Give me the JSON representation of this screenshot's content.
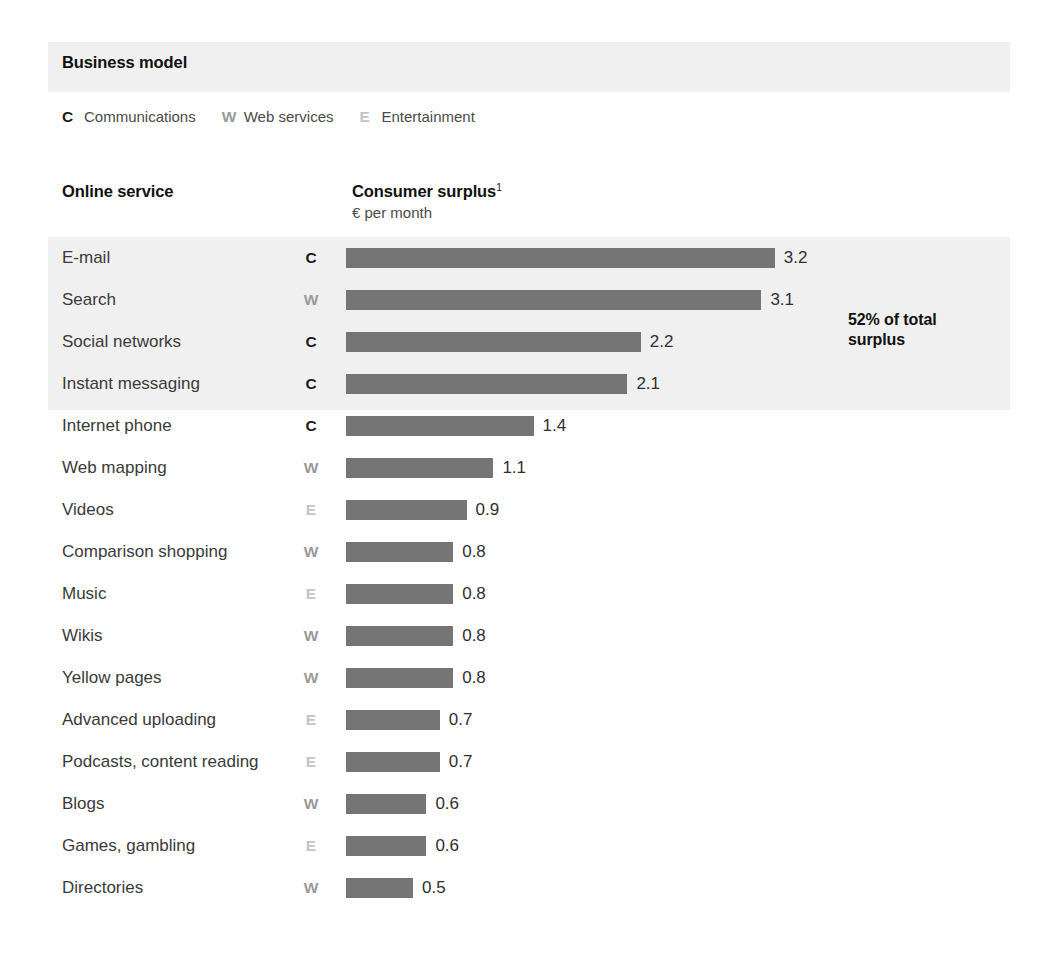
{
  "business_model": {
    "heading": "Business model",
    "legend": [
      {
        "key": "C",
        "label": "Communications",
        "color": "#1a1a1a"
      },
      {
        "key": "W",
        "label": "Web services",
        "color": "#9a9a9a"
      },
      {
        "key": "E",
        "label": "Entertainment",
        "color": "#c4c4c4"
      }
    ]
  },
  "columns": {
    "service": "Online service",
    "surplus_main": "Consumer surplus",
    "surplus_footnote_marker": "1",
    "surplus_sub": "€ per month"
  },
  "highlight": {
    "note_line1": "52% of total",
    "note_line2": "surplus",
    "rows_covered": 4,
    "band_color": "#f0f0f0"
  },
  "chart_data": {
    "type": "bar",
    "orientation": "horizontal",
    "title": "Consumer surplus",
    "subtitle": "€ per month",
    "xlabel": "€ per month",
    "ylabel": "Online service",
    "grid": false,
    "legend_position": "top",
    "xlim": [
      0,
      3.2
    ],
    "bar_color": "#757575",
    "categories": [
      "E-mail",
      "Search",
      "Social networks",
      "Instant messaging",
      "Internet phone",
      "Web mapping",
      "Videos",
      "Comparison shopping",
      "Music",
      "Wikis",
      "Yellow pages",
      "Advanced uploading",
      "Podcasts, content reading",
      "Blogs",
      "Games, gambling",
      "Directories"
    ],
    "values": [
      3.2,
      3.1,
      2.2,
      2.1,
      1.4,
      1.1,
      0.9,
      0.8,
      0.8,
      0.8,
      0.8,
      0.7,
      0.7,
      0.6,
      0.6,
      0.5
    ],
    "value_labels": [
      "3.2",
      "3.1",
      "2.2",
      "2.1",
      "1.4",
      "1.1",
      "0.9",
      "0.8",
      "0.8",
      "0.8",
      "0.8",
      "0.7",
      "0.7",
      "0.6",
      "0.6",
      "0.5"
    ],
    "business_models": [
      "C",
      "W",
      "C",
      "C",
      "C",
      "W",
      "E",
      "W",
      "E",
      "W",
      "W",
      "E",
      "E",
      "W",
      "E",
      "W"
    ],
    "annotations": [
      {
        "text": "52% of total surplus",
        "applies_to_rows": [
          "E-mail",
          "Search",
          "Social networks",
          "Instant messaging"
        ]
      }
    ]
  },
  "rows": [
    {
      "service": "E-mail",
      "key": "C",
      "value": "3.2",
      "num": 3.2
    },
    {
      "service": "Search",
      "key": "W",
      "value": "3.1",
      "num": 3.1
    },
    {
      "service": "Social networks",
      "key": "C",
      "value": "2.2",
      "num": 2.2
    },
    {
      "service": "Instant messaging",
      "key": "C",
      "value": "2.1",
      "num": 2.1
    },
    {
      "service": "Internet phone",
      "key": "C",
      "value": "1.4",
      "num": 1.4
    },
    {
      "service": "Web mapping",
      "key": "W",
      "value": "1.1",
      "num": 1.1
    },
    {
      "service": "Videos",
      "key": "E",
      "value": "0.9",
      "num": 0.9
    },
    {
      "service": "Comparison shopping",
      "key": "W",
      "value": "0.8",
      "num": 0.8
    },
    {
      "service": "Music",
      "key": "E",
      "value": "0.8",
      "num": 0.8
    },
    {
      "service": "Wikis",
      "key": "W",
      "value": "0.8",
      "num": 0.8
    },
    {
      "service": "Yellow pages",
      "key": "W",
      "value": "0.8",
      "num": 0.8
    },
    {
      "service": "Advanced uploading",
      "key": "E",
      "value": "0.7",
      "num": 0.7
    },
    {
      "service": "Podcasts, content reading",
      "key": "E",
      "value": "0.7",
      "num": 0.7
    },
    {
      "service": "Blogs",
      "key": "W",
      "value": "0.6",
      "num": 0.6
    },
    {
      "service": "Games, gambling",
      "key": "E",
      "value": "0.6",
      "num": 0.6
    },
    {
      "service": "Directories",
      "key": "W",
      "value": "0.5",
      "num": 0.5
    }
  ],
  "layout": {
    "row_top": 237,
    "row_height": 42,
    "bar_left": 346,
    "px_per_unit": 134
  },
  "key_colors": {
    "C": "#1a1a1a",
    "W": "#9a9a9a",
    "E": "#c4c4c4"
  }
}
